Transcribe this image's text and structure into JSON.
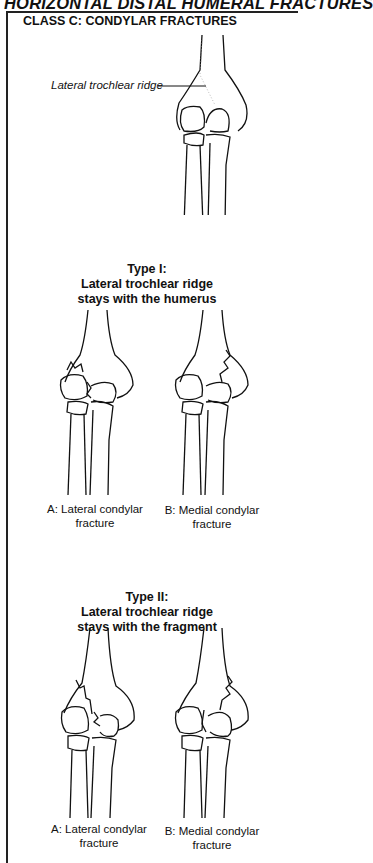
{
  "header": {
    "title": "HORIZONTAL DISTAL HUMERAL FRACTURES"
  },
  "figure": {
    "class_title": "CLASS C: CONDYLAR FRACTURES",
    "top_label": "Lateral trochlear ridge",
    "types": [
      {
        "title_line1": "Type I:",
        "title_line2": "Lateral trochlear ridge",
        "title_line3": "stays with the humerus",
        "captions": [
          {
            "line1": "A: Lateral condylar",
            "line2": "fracture"
          },
          {
            "line1": "B: Medial condylar",
            "line2": "fracture"
          }
        ]
      },
      {
        "title_line1": "Type II:",
        "title_line2": "Lateral trochlear ridge",
        "title_line3": "stays with the fragment",
        "captions": [
          {
            "line1": "A: Lateral condylar",
            "line2": "fracture"
          },
          {
            "line1": "B: Medial condylar",
            "line2": "fracture"
          }
        ]
      }
    ]
  }
}
